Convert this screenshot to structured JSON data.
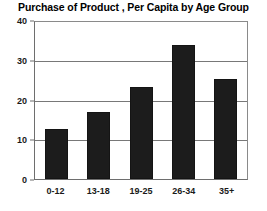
{
  "chart_data": {
    "type": "bar",
    "title": "Purchase of Product , Per Capita by Age Group",
    "xlabel": "",
    "ylabel": "",
    "categories": [
      "0-12",
      "13-18",
      "19-25",
      "26-34",
      "35+"
    ],
    "values": [
      12.7,
      17.0,
      23.4,
      34.2,
      25.6
    ],
    "ylim": [
      0,
      40
    ],
    "yticks": [
      "0",
      "10",
      "20",
      "30",
      "40"
    ],
    "ytick_values": [
      0,
      10,
      20,
      30,
      40
    ],
    "grid": true,
    "legend": false,
    "legend_position": "none",
    "bar_color": "#1c1c1c",
    "grid_color": "#787878",
    "background_color": "#ffffff",
    "text_color": "#000000"
  }
}
